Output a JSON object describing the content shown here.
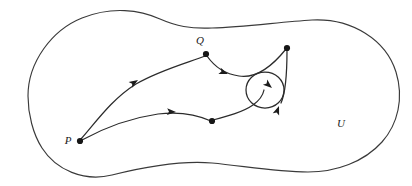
{
  "figure": {
    "kind": "topology-diagram",
    "caption_absent": true,
    "background_color": "#ffffff",
    "stroke_color": "#2b2b2b",
    "boundary_color": "#3a3a3a",
    "labels": [
      {
        "id": "point-p",
        "text": "P",
        "x": 68,
        "y": 144,
        "role": "start-point-label"
      },
      {
        "id": "point-q",
        "text": "Q",
        "x": 200,
        "y": 44,
        "role": "intermediate-point-label"
      },
      {
        "id": "region-u",
        "text": "U",
        "x": 341,
        "y": 127,
        "role": "region-label"
      }
    ],
    "nodes": [
      {
        "id": "node-p",
        "x": 80,
        "y": 141,
        "r": 3.1,
        "label": "P"
      },
      {
        "id": "node-q",
        "x": 206,
        "y": 54,
        "r": 3.1,
        "label": "Q"
      },
      {
        "id": "node-top-right",
        "x": 287,
        "y": 48,
        "r": 3.1,
        "label": ""
      },
      {
        "id": "node-bottom-mid",
        "x": 212,
        "y": 121,
        "r": 3.1,
        "label": ""
      }
    ],
    "curves": [
      {
        "id": "curve-p-to-q",
        "d": "M 81,139 C 96,122 112,99 136,84 C 160,70 190,62 205,56"
      },
      {
        "id": "curve-q-to-topright",
        "d": "M 207,56 C 214,66 224,74 239,76 C 258,79 274,64 286,49"
      },
      {
        "id": "curve-p-to-bottommid",
        "d": "M 82,140 C 104,128 130,118 158,114 C 182,111 200,116 211,121"
      },
      {
        "id": "curve-bottommid-to-loop",
        "d": "M 213,120 C 228,116 243,112 253,105 C 260,100 263,95 264,90"
      },
      {
        "id": "curve-loop-to-topright",
        "d": "M 281,103 C 286,92 287,72 287,50"
      }
    ],
    "loop": {
      "id": "small-loop",
      "cx": 265,
      "cy": 90,
      "rx": 19,
      "ry": 18
    },
    "arrows": [
      {
        "id": "arrow-upper-path",
        "x": 138,
        "y": 80,
        "angle": -33,
        "on": "curve-p-to-q"
      },
      {
        "id": "arrow-lower-path",
        "x": 176,
        "y": 112,
        "angle": 3,
        "on": "curve-p-to-bottommid"
      },
      {
        "id": "arrow-from-q",
        "x": 228,
        "y": 74,
        "angle": 20,
        "on": "curve-q-to-topright"
      },
      {
        "id": "arrow-loop-right",
        "x": 272,
        "y": 88,
        "angle": 40,
        "on": "small-loop"
      },
      {
        "id": "arrow-loop-up",
        "x": 279,
        "y": 106,
        "angle": -70,
        "on": "curve-loop-to-topright"
      }
    ],
    "boundary": {
      "id": "region-outline",
      "d": "M 28,96 C 28,62 52,30 82,18 C 112,6 140,10 160,19 C 176,26 190,29 212,28 C 244,27 280,22 312,20 C 352,18 386,40 396,72 C 404,98 398,124 382,142 C 364,162 336,172 308,172 C 276,172 244,166 212,163 C 178,160 140,168 112,175 C 84,182 56,170 42,148 C 33,134 28,114 28,96 Z"
    }
  }
}
